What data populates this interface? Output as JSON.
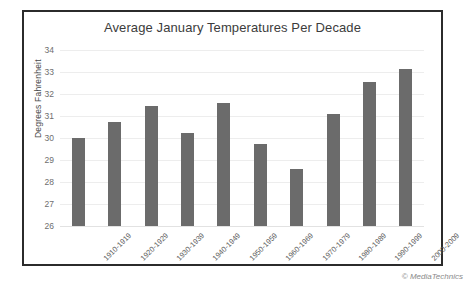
{
  "credit": "© MediaTechnics",
  "chart_data": {
    "type": "bar",
    "title": "Average January Temperatures Per Decade",
    "xlabel": "",
    "ylabel": "Degrees Fahrenheit",
    "ylim": [
      26,
      34
    ],
    "ytick_step": 1,
    "yticks": [
      "34",
      "33",
      "32",
      "31",
      "30",
      "29",
      "28",
      "27",
      "26"
    ],
    "grid": true,
    "legend": false,
    "bar_color": "#6b6b6b",
    "categories": [
      "1910-1919",
      "1920-1929",
      "1930-1939",
      "1940-1949",
      "1950-1959",
      "1960-1969",
      "1970-1979",
      "1980-1989",
      "1990-1999",
      "2000-2009"
    ],
    "values": [
      30.0,
      30.75,
      31.45,
      30.25,
      31.6,
      29.75,
      28.6,
      31.1,
      32.55,
      33.15
    ]
  }
}
